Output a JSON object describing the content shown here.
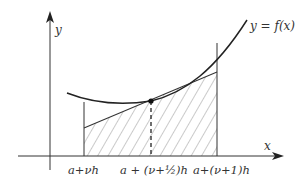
{
  "diagram": {
    "type": "midpoint-tangent-quadrature",
    "axes": {
      "x_label": "x",
      "y_label": "y"
    },
    "curve_label": "y = f(x)",
    "ticks": {
      "left": "a+νh",
      "mid": "a + (ν+½)h",
      "right": "a+(ν+1)h"
    },
    "colors": {
      "stroke": "#333333",
      "hatch": "#555555",
      "background": "#ffffff"
    }
  }
}
